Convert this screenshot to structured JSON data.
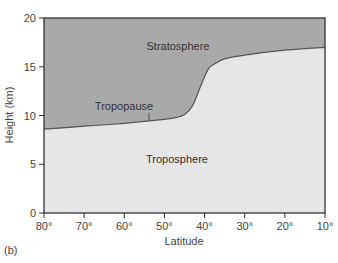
{
  "chart_data": {
    "type": "area",
    "title": "",
    "xlabel": "Latitude",
    "ylabel": "Height (km)",
    "xlim": [
      80,
      10
    ],
    "ylim": [
      0,
      20
    ],
    "x_ticks": [
      "80°",
      "70°",
      "60°",
      "50°",
      "40°",
      "30°",
      "20°",
      "10°"
    ],
    "y_ticks": [
      "0",
      "5",
      "10",
      "15",
      "20"
    ],
    "grid": false,
    "series": [
      {
        "name": "Tropopause",
        "x": [
          80,
          70,
          60,
          55,
          50,
          47,
          45,
          43,
          41,
          39,
          37,
          35,
          30,
          20,
          10
        ],
        "values": [
          8.6,
          8.9,
          9.2,
          9.4,
          9.6,
          9.8,
          10.1,
          11.0,
          13.0,
          14.8,
          15.4,
          15.8,
          16.2,
          16.7,
          17.0
        ]
      }
    ],
    "regions": [
      {
        "name": "Stratosphere",
        "position": "above tropopause",
        "color": "#a9a9a9"
      },
      {
        "name": "Troposphere",
        "position": "below tropopause",
        "color": "#e6e6e6"
      }
    ],
    "annotations": [
      {
        "text": "Stratosphere",
        "x": 47,
        "y": 17.2
      },
      {
        "text": "Tropopause",
        "x": 55,
        "y": 10.8,
        "pointer_to": [
          54,
          9.35
        ]
      },
      {
        "text": "Troposphere",
        "x": 47,
        "y": 5.2
      }
    ]
  },
  "labels": {
    "xlabel": "Latitude",
    "ylabel": "Height (km)",
    "stratosphere": "Stratosphere",
    "tropopause": "Tropopause",
    "troposphere": "Troposphere",
    "panel": "(b)",
    "x_ticks": [
      "80°",
      "70°",
      "60°",
      "50°",
      "40°",
      "30°",
      "20°",
      "10°"
    ],
    "y_ticks": [
      "0",
      "5",
      "10",
      "15",
      "20"
    ]
  },
  "colors": {
    "stratosphere": "#a9a9a9",
    "troposphere": "#e6e6e6",
    "axis": "#333333",
    "curve": "#555555"
  }
}
